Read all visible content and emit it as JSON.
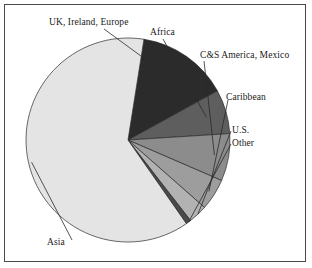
{
  "chart_data": {
    "type": "pie",
    "title": "",
    "xlabel": "",
    "ylabel": "",
    "legend_position": "none",
    "grid": false,
    "labels_outside": true,
    "start_angle_deg": 9,
    "direction": "clockwise",
    "categories": [
      "UK, Ireland, Europe",
      "Africa",
      "C&S America, Mexico",
      "Caribbean",
      "U.S.",
      "Other",
      "Asia"
    ],
    "values": [
      14.5,
      7.0,
      7.5,
      5.0,
      3.0,
      0.8,
      62.2
    ],
    "colors": [
      "#2b2b2b",
      "#5e5e5e",
      "#8c8c8c",
      "#9d9d9d",
      "#b2b2b2",
      "#4a4a4a",
      "#e4e4e4"
    ],
    "slices": [
      {
        "label": "UK, Ireland, Europe",
        "value": 14.5,
        "color": "#2b2b2b"
      },
      {
        "label": "Africa",
        "value": 7.0,
        "color": "#5e5e5e"
      },
      {
        "label": "C&S America, Mexico",
        "value": 7.5,
        "color": "#8c8c8c"
      },
      {
        "label": "Caribbean",
        "value": 5.0,
        "color": "#9d9d9d"
      },
      {
        "label": "U.S.",
        "value": 3.0,
        "color": "#b2b2b2"
      },
      {
        "label": "Other",
        "value": 0.8,
        "color": "#4a4a4a"
      },
      {
        "label": "Asia",
        "value": 62.2,
        "color": "#e4e4e4"
      }
    ]
  },
  "labels": {
    "uk_ireland_europe": "UK, Ireland, Europe",
    "africa": "Africa",
    "cs_america_mexico": "C&S America, Mexico",
    "caribbean": "Caribbean",
    "us": "U.S.",
    "other": "Other",
    "asia": "Asia"
  },
  "style": {
    "border_color": "#4a4a4a",
    "outline_color": "#2a2a2a",
    "background": "#ffffff",
    "text_color": "#1a1a1a"
  }
}
